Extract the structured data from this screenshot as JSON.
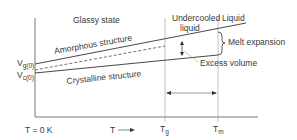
{
  "diagram": {
    "title": "",
    "region_labels": {
      "glassy_state": "Glassy state",
      "undercooled_liquid_line1": "Undercooled",
      "undercooled_liquid_line2": "liquid",
      "liquid": "Liquid"
    },
    "curve_labels": {
      "amorphous": "Amorphous structure",
      "crystalline": "Crystalline structure"
    },
    "annotations": {
      "melt_expansion": "Melt expansion",
      "excess_volume": "Excess volume"
    },
    "y_axis": {
      "vg0_main": "V",
      "vg0_sub": "g(0)",
      "vc0_main": "V",
      "vc0_sub": "c(0)"
    },
    "x_axis": {
      "origin": "T = 0 K",
      "t_arrow": "T",
      "tg_main": "T",
      "tg_sub": "g",
      "tm_main": "T",
      "tm_sub": "m"
    },
    "colors": {
      "line": "#333333",
      "guide": "#999999"
    }
  }
}
